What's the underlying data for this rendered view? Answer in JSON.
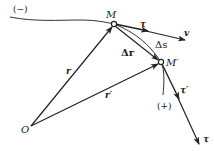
{
  "diagram": {
    "labels": {
      "minus_direction": "(−)",
      "plus_direction": "(+)",
      "point_M": "M",
      "point_M_prime": "M′",
      "origin": "O",
      "position_vector": "r",
      "position_vector_prime": "r′",
      "displacement": "Δr",
      "arc_length": "Δs",
      "tangent_unit": "τ",
      "velocity": "v",
      "tangent_unit_prime": "τ′",
      "tangent_unit_shifted": "τ"
    },
    "colors": {
      "line": "#222222",
      "background": "#ffffff"
    }
  }
}
